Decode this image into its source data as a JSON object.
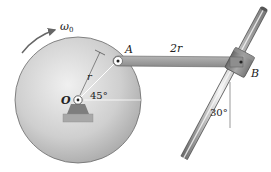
{
  "figure": {
    "labels": {
      "omega": "ω",
      "omega_sub": "0",
      "point_A": "A",
      "point_B": "B",
      "point_O": "O",
      "radius": "r",
      "link_length": "2r",
      "angle_disk": "45°",
      "angle_rod": "30°"
    },
    "colors": {
      "disk_light": "#e6e6e6",
      "disk_dark": "#a9a9a9",
      "link": "#9a9a9a",
      "rod_light": "#eeeeee",
      "rod_dark": "#777777",
      "collar": "#8c8c8c",
      "outline": "#555555",
      "text": "#222222"
    }
  }
}
